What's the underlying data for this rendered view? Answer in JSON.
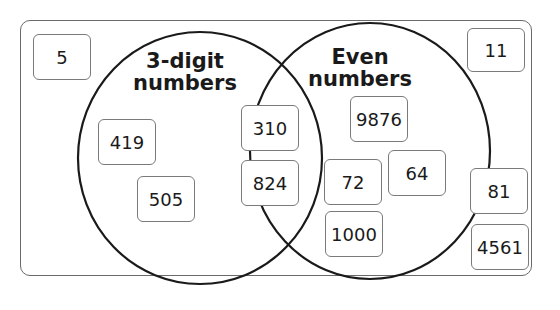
{
  "diagram": {
    "type": "venn",
    "sets": [
      {
        "id": "A",
        "label_line1": "3-digit",
        "label_line2": "numbers"
      },
      {
        "id": "B",
        "label_line1": "Even",
        "label_line2": "numbers"
      }
    ],
    "regions": {
      "only_A": [
        "419",
        "505"
      ],
      "A_and_B": [
        "310",
        "824"
      ],
      "only_B": [
        "9876",
        "72",
        "64",
        "1000"
      ],
      "neither": [
        "5",
        "11",
        "81",
        "4561"
      ]
    },
    "boxes": {
      "n5": "5",
      "n11": "11",
      "n419": "419",
      "n505": "505",
      "n310": "310",
      "n824": "824",
      "n9876": "9876",
      "n72": "72",
      "n64": "64",
      "n1000": "1000",
      "n81": "81",
      "n4561": "4561"
    },
    "colors": {
      "outline": "#1a1a1a",
      "box_border": "#7a7a7a",
      "frame": "#6a6a6a"
    }
  }
}
